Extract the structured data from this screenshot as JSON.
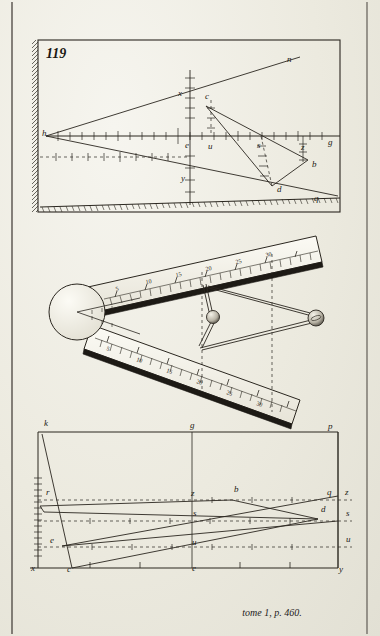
{
  "plate": {
    "figure_number": "119",
    "caption": "tome 1, p. 460.",
    "ink_color": "#1d1a15",
    "paper_color": "#efeee8"
  },
  "panel_top": {
    "name": "surveying-geometry-figure",
    "labels": [
      {
        "id": "h",
        "text": "h",
        "x": 42,
        "y": 136
      },
      {
        "id": "x",
        "text": "x",
        "x": 178,
        "y": 96
      },
      {
        "id": "c",
        "text": "c",
        "x": 205,
        "y": 99
      },
      {
        "id": "n",
        "text": "n",
        "x": 287,
        "y": 62
      },
      {
        "id": "e",
        "text": "e",
        "x": 185,
        "y": 148
      },
      {
        "id": "u",
        "text": "u",
        "x": 208,
        "y": 149
      },
      {
        "id": "s",
        "text": "s",
        "x": 257,
        "y": 148
      },
      {
        "id": "z",
        "text": "z",
        "x": 301,
        "y": 150
      },
      {
        "id": "g",
        "text": "g",
        "x": 328,
        "y": 145
      },
      {
        "id": "b",
        "text": "b",
        "x": 312,
        "y": 167
      },
      {
        "id": "d",
        "text": "d",
        "x": 277,
        "y": 192
      },
      {
        "id": "y",
        "text": "y",
        "x": 181,
        "y": 181
      },
      {
        "id": "q",
        "text": "q",
        "x": 314,
        "y": 201
      }
    ]
  },
  "panel_middle": {
    "name": "sector-instrument-figure",
    "upper_scale_labels": [
      "5",
      "10",
      "15",
      "20",
      "25",
      "30"
    ],
    "lower_scale_labels": [
      "5",
      "10",
      "15",
      "20",
      "25",
      "30"
    ]
  },
  "panel_bottom": {
    "name": "plane-table-geometry-figure",
    "labels": [
      {
        "id": "k",
        "text": "k",
        "x": 44,
        "y": 426
      },
      {
        "id": "g",
        "text": "g",
        "x": 190,
        "y": 428
      },
      {
        "id": "p",
        "text": "p",
        "x": 328,
        "y": 429
      },
      {
        "id": "r",
        "text": "r",
        "x": 46,
        "y": 495
      },
      {
        "id": "z_left",
        "text": "z",
        "x": 191,
        "y": 496
      },
      {
        "id": "b",
        "text": "b",
        "x": 234,
        "y": 492
      },
      {
        "id": "q",
        "text": "q",
        "x": 327,
        "y": 495
      },
      {
        "id": "z_right",
        "text": "z",
        "x": 345,
        "y": 495
      },
      {
        "id": "s_mid",
        "text": "s",
        "x": 193,
        "y": 516
      },
      {
        "id": "d",
        "text": "d",
        "x": 321,
        "y": 512
      },
      {
        "id": "s_right",
        "text": "s",
        "x": 346,
        "y": 516
      },
      {
        "id": "e_left",
        "text": "e",
        "x": 50,
        "y": 543
      },
      {
        "id": "u_mid",
        "text": "u",
        "x": 192,
        "y": 545
      },
      {
        "id": "u_right",
        "text": "u",
        "x": 346,
        "y": 542
      },
      {
        "id": "x",
        "text": "x",
        "x": 31,
        "y": 571
      },
      {
        "id": "c",
        "text": "c",
        "x": 67,
        "y": 572
      },
      {
        "id": "e_bottom",
        "text": "e",
        "x": 192,
        "y": 571
      },
      {
        "id": "y",
        "text": "y",
        "x": 339,
        "y": 572
      }
    ]
  }
}
